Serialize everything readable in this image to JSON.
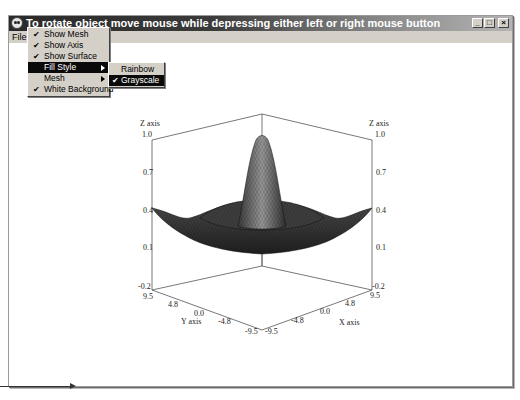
{
  "window": {
    "title": "To rotate object move mouse while depressing either left or right mouse button",
    "controls": {
      "minimize": "_",
      "maximize": "□",
      "close": "×"
    }
  },
  "menubar": {
    "items": [
      {
        "label": "File"
      },
      {
        "label": "Options",
        "active": true
      },
      {
        "label": "Help"
      }
    ]
  },
  "options_menu": {
    "items": [
      {
        "label": "Show Mesh",
        "checked": true,
        "submenu": false
      },
      {
        "label": "Show Axis",
        "checked": true,
        "submenu": false
      },
      {
        "label": "Show Surface",
        "checked": true,
        "submenu": false
      },
      {
        "label": "Fill Style",
        "checked": false,
        "submenu": true,
        "highlighted": true
      },
      {
        "label": "Mesh",
        "checked": false,
        "submenu": true
      },
      {
        "label": "White Background",
        "checked": true,
        "submenu": false
      }
    ],
    "check_glyph": "✔"
  },
  "fill_style_submenu": {
    "items": [
      {
        "label": "Rainbow",
        "checked": false
      },
      {
        "label": "Grayscale",
        "checked": true,
        "highlighted": true
      }
    ]
  },
  "plot": {
    "z_axis_label": "Z axis",
    "x_axis_label": "X axis",
    "y_axis_label": "Y axis",
    "z_ticks": [
      "1.0",
      "0.7",
      "0.4",
      "0.1",
      "-0.2"
    ],
    "x_ticks": [
      "9.5",
      "4.8",
      "0.0",
      "-4.8",
      "-9.5"
    ],
    "y_ticks": [
      "9.5",
      "4.8",
      "0.0",
      "-4.8",
      "-9.5"
    ],
    "surface_fill": "grayscale",
    "colors": {
      "axis": "#555555",
      "surface_dark": "#2a2a2a",
      "surface_light": "#a8a8a8"
    }
  }
}
